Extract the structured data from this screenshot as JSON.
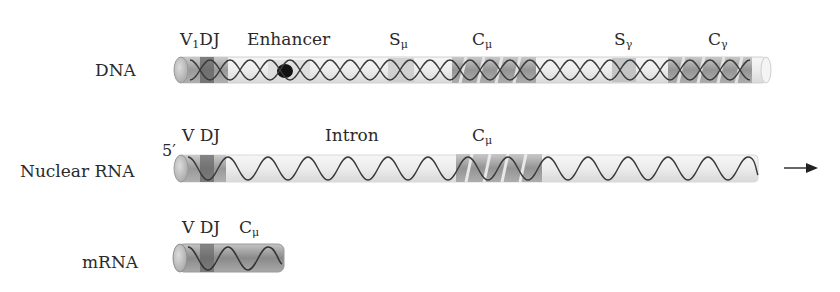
{
  "rows": {
    "dna": {
      "label": "DNA",
      "segments": [
        {
          "main": "V",
          "sub": "1",
          "rest": "DJ"
        },
        {
          "main": "Enhancer"
        },
        {
          "main": "S",
          "sub": "μ"
        },
        {
          "main": "C",
          "sub": "μ"
        },
        {
          "main": "S",
          "sub": "γ"
        },
        {
          "main": "C",
          "sub": "γ"
        }
      ]
    },
    "nuclear_rna": {
      "label": "Nuclear RNA",
      "five_prime": "5′",
      "segments": [
        {
          "main": "V DJ"
        },
        {
          "main": "Intron"
        },
        {
          "main": "C",
          "sub": "μ"
        }
      ]
    },
    "mrna": {
      "label": "mRNA",
      "segments": [
        {
          "main": "V DJ"
        },
        {
          "main": "C",
          "sub": "μ"
        }
      ]
    }
  },
  "arrow": {
    "direction": "right"
  },
  "colors": {
    "tube_fill": "#ececec",
    "segment_fill": "#9a9a9a",
    "strand": "#3a3a3a",
    "enhancer": "#111111",
    "text": "#2a2a2a"
  }
}
